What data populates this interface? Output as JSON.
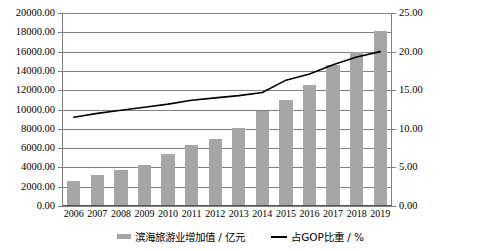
{
  "chart_data": {
    "type": "bar",
    "title": "",
    "subtitle": "",
    "xlabel": "",
    "categories": [
      "2006",
      "2007",
      "2008",
      "2009",
      "2010",
      "2011",
      "2012",
      "2013",
      "2014",
      "2015",
      "2016",
      "2017",
      "2018",
      "2019"
    ],
    "series": [
      {
        "name": "滨海旅游业增加值 / 亿元",
        "type": "bar",
        "axis": "left",
        "color": "#a6a6a6",
        "values": [
          2600,
          3200,
          3700,
          4300,
          5400,
          6300,
          6900,
          8100,
          9800,
          11000,
          12500,
          14600,
          16000,
          18100
        ]
      },
      {
        "name": "占GOP比重 / %",
        "type": "line",
        "axis": "right",
        "color": "#000000",
        "values": [
          11.5,
          12.0,
          12.4,
          12.8,
          13.2,
          13.7,
          14.0,
          14.3,
          14.7,
          16.3,
          17.1,
          18.3,
          19.3,
          20.0
        ]
      }
    ],
    "left_axis": {
      "label": "",
      "ylim": [
        0,
        20000
      ],
      "ticks": [
        "0.00",
        "2000.00",
        "4000.00",
        "6000.00",
        "8000.00",
        "10000.00",
        "12000.00",
        "14000.00",
        "16000.00",
        "18000.00",
        "20000.00"
      ],
      "tick_values": [
        0,
        2000,
        4000,
        6000,
        8000,
        10000,
        12000,
        14000,
        16000,
        18000,
        20000
      ]
    },
    "right_axis": {
      "label": "",
      "ylim": [
        0,
        25
      ],
      "ticks": [
        "0.00",
        "5.00",
        "10.00",
        "15.00",
        "20.00",
        "25.00"
      ],
      "tick_values": [
        0,
        5,
        10,
        15,
        20,
        25
      ]
    },
    "grid": true,
    "legend": {
      "position": "bottom",
      "entries": [
        {
          "label": "滨海旅游业增加值 / 亿元",
          "marker": "bar-swatch",
          "color": "#a6a6a6"
        },
        {
          "label": "占GOP比重 / %",
          "marker": "line-swatch",
          "color": "#000000"
        }
      ]
    }
  }
}
